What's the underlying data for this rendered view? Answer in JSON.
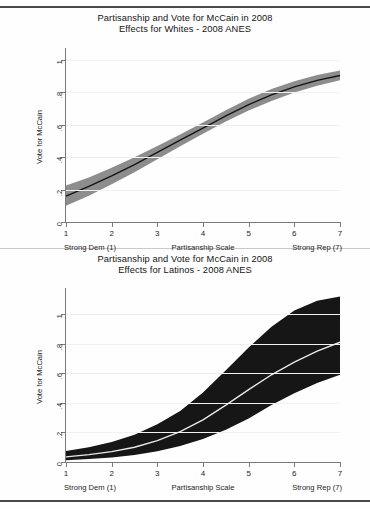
{
  "document": {
    "background": "#fefefe",
    "rules": [
      "top-rule",
      "mid-rule",
      "bottom-rule"
    ]
  },
  "figures": [
    {
      "id": "whites",
      "title_line1": "Partisanship and Vote for McCain in 2008",
      "title_line2": "Effects for Whites - 2008 ANES",
      "caption_left": "Strong Dem (1)",
      "caption_center": "Partisanship Scale",
      "caption_right": "Strong Rep (7)",
      "band_color": "#8d8d8d",
      "line_color": "#151515"
    },
    {
      "id": "latinos",
      "title_line1": "Partisanship and Vote for McCain in 2008",
      "title_line2": "Effects for Latinos - 2008 ANES",
      "caption_left": "Strong Dem (1)",
      "caption_center": "Partisanship Scale",
      "caption_right": "Strong Rep (7)",
      "band_color": "#161616",
      "line_color": "#e8e8e8"
    }
  ],
  "chart_data": [
    {
      "type": "line",
      "id": "whites",
      "title": "Partisanship and Vote for McCain in 2008\nEffects for Whites - 2008 ANES",
      "xlabel": "Partisanship Scale",
      "ylabel": "Vote for McCain",
      "xlim": [
        1,
        7
      ],
      "ylim": [
        0,
        1.05
      ],
      "xticks": [
        1,
        2,
        3,
        4,
        5,
        6,
        7
      ],
      "xticklabels": [
        "1",
        "2",
        "3",
        "4",
        "5",
        "6",
        "7"
      ],
      "yticks": [
        0,
        0.2,
        0.4,
        0.6,
        0.8,
        1
      ],
      "yticklabels": [
        "0",
        ".2",
        ".4",
        ".6",
        ".8",
        "1"
      ],
      "grid": true,
      "legend": "none",
      "annotations": [
        "Strong Dem (1)",
        "Partisanship Scale",
        "Strong Rep (7)"
      ],
      "x": [
        1,
        1.5,
        2,
        2.5,
        3,
        3.5,
        4,
        4.5,
        5,
        5.5,
        6,
        6.5,
        7
      ],
      "series": [
        {
          "name": "Predicted probability",
          "values": [
            0.16,
            0.22,
            0.285,
            0.355,
            0.43,
            0.505,
            0.58,
            0.655,
            0.725,
            0.785,
            0.835,
            0.875,
            0.905
          ]
        },
        {
          "name": "95% CI upper",
          "values": [
            0.225,
            0.275,
            0.335,
            0.4,
            0.47,
            0.54,
            0.615,
            0.69,
            0.762,
            0.822,
            0.87,
            0.908,
            0.935
          ]
        },
        {
          "name": "95% CI lower",
          "values": [
            0.1,
            0.162,
            0.233,
            0.308,
            0.388,
            0.468,
            0.545,
            0.62,
            0.688,
            0.748,
            0.8,
            0.842,
            0.875
          ]
        }
      ]
    },
    {
      "type": "line",
      "id": "latinos",
      "title": "Partisanship and Vote for McCain in 2008\nEffects for Latinos - 2008 ANES",
      "xlabel": "Partisanship Scale",
      "ylabel": "Vote for McCain",
      "xlim": [
        1,
        7
      ],
      "ylim": [
        0,
        1.15
      ],
      "xticks": [
        1,
        2,
        3,
        4,
        5,
        6,
        7
      ],
      "xticklabels": [
        "1",
        "2",
        "3",
        "4",
        "5",
        "6",
        "7"
      ],
      "yticks": [
        0,
        0.2,
        0.4,
        0.6,
        0.8,
        1
      ],
      "yticklabels": [
        "0",
        ".2",
        ".4",
        ".6",
        ".8",
        "1"
      ],
      "grid": true,
      "legend": "none",
      "annotations": [
        "Strong Dem (1)",
        "Partisanship Scale",
        "Strong Rep (7)"
      ],
      "x": [
        1,
        1.5,
        2,
        2.5,
        3,
        3.5,
        4,
        4.5,
        5,
        5.5,
        6,
        6.5,
        7
      ],
      "series": [
        {
          "name": "Predicted probability",
          "values": [
            0.035,
            0.05,
            0.07,
            0.1,
            0.145,
            0.205,
            0.285,
            0.385,
            0.49,
            0.59,
            0.675,
            0.75,
            0.81
          ]
        },
        {
          "name": "95% CI upper",
          "values": [
            0.075,
            0.1,
            0.135,
            0.185,
            0.255,
            0.345,
            0.47,
            0.62,
            0.775,
            0.915,
            1.025,
            1.09,
            1.12
          ]
        },
        {
          "name": "95% CI lower",
          "values": [
            0.012,
            0.02,
            0.03,
            0.048,
            0.073,
            0.108,
            0.155,
            0.218,
            0.295,
            0.385,
            0.465,
            0.535,
            0.59
          ]
        }
      ]
    }
  ]
}
